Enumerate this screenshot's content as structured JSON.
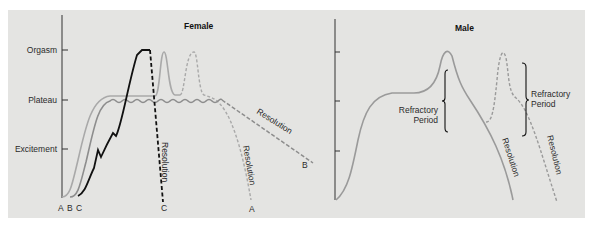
{
  "female": {
    "title": "Female",
    "y_axis_labels": [
      "Orgasm",
      "Plateau",
      "Excitement"
    ],
    "curve_labels": {
      "start_a": "A",
      "start_b": "B",
      "start_c": "C",
      "end_c": "C",
      "end_a": "A",
      "end_b": "B"
    },
    "resolution_c": "Resolution",
    "resolution_a": "Resolution",
    "resolution_b": "Resolution"
  },
  "male": {
    "title": "Male",
    "refractory_1": [
      "Refractory",
      "Period"
    ],
    "refractory_2": [
      "Refractory",
      "Period"
    ],
    "resolution_1": "Resolution",
    "resolution_2": "Resolution"
  },
  "colors": {
    "background": "#e4e4e2",
    "curve_a": "#a8a8a8",
    "curve_b": "#8e8e8e",
    "curve_c": "#111111",
    "male_curve": "#9a9a9a",
    "axis": "#333333"
  }
}
